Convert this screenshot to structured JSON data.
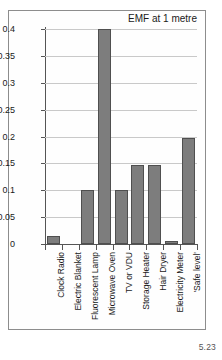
{
  "figure": {
    "number_label": "5.23"
  },
  "chart_data": {
    "type": "bar",
    "title": "EMF at 1 metre",
    "xlabel": "",
    "ylabel": "",
    "ylim": [
      0,
      0.4
    ],
    "grid": true,
    "legend": "none",
    "categories": [
      "Clock Radio",
      "Electric Blanket",
      "Fluorescent Lamp",
      "Microwave Oven",
      "TV or VDU",
      "Storage Heater",
      "Hair Dryer",
      "Electricity Meter",
      "'Safe level'"
    ],
    "values": [
      0.015,
      0.0,
      0.1,
      0.4,
      0.1,
      0.147,
      0.147,
      0.005,
      0.197
    ],
    "ytick_labels": [
      "0",
      "0.05",
      "0.1",
      "0.15",
      "0.2",
      "0.25",
      "0.3",
      "0.35",
      "0.4"
    ],
    "ytick_values": [
      0,
      0.05,
      0.1,
      0.15,
      0.2,
      0.25,
      0.3,
      0.35,
      0.4
    ],
    "bar_color": "#7d7d7d",
    "bar_edge_color": "#4f4f4f",
    "grid_color": "#c9c9c9",
    "axis_color": "#555555"
  }
}
